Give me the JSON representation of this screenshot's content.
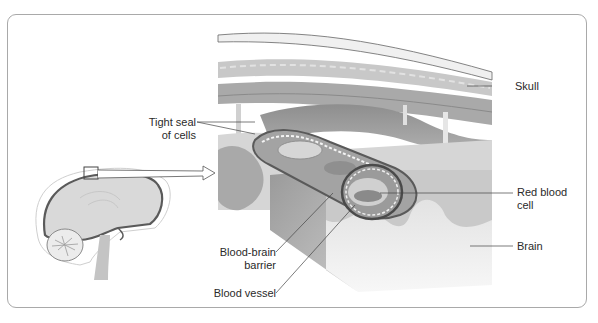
{
  "diagram": {
    "title_visible": false,
    "subject": "Blood-brain barrier",
    "labels": {
      "skull": "Skull",
      "tight_seal_line1": "Tight seal",
      "tight_seal_line2": "of cells",
      "red_blood_cell_line1": "Red blood",
      "red_blood_cell_line2": "cell",
      "brain": "Brain",
      "bbb_line1": "Blood-brain",
      "bbb_line2": "barrier",
      "blood_vessel": "Blood vessel"
    },
    "colors": {
      "frame": "#a9a9a9",
      "tissue_light": "#e6e6e6",
      "tissue_mid": "#bdbdbd",
      "tissue_dark": "#7d7d7d",
      "outline": "#555555",
      "text": "#2a2a2a"
    }
  }
}
